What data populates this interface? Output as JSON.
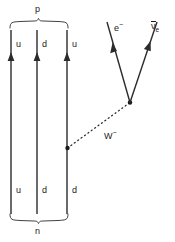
{
  "diagram": {
    "colors": {
      "line": "#2b2b2b",
      "background": "#ffffff",
      "text": "#1a1a1a"
    },
    "top_bracket": {
      "label": "p",
      "meaning": "proton"
    },
    "bottom_bracket": {
      "label": "n",
      "meaning": "neutron"
    },
    "quark_lines": [
      {
        "id": "quark-line-1",
        "top_label": "u",
        "bottom_label": "u",
        "x": 11,
        "arrow_y": 58
      },
      {
        "id": "quark-line-2",
        "top_label": "d",
        "bottom_label": "d",
        "x": 37,
        "arrow_y": 58
      },
      {
        "id": "quark-line-3",
        "top_label": "u",
        "bottom_label": "d",
        "x": 67,
        "arrow_y": 58
      }
    ],
    "boson": {
      "label": "W",
      "charge": "−",
      "style": "dotted",
      "from": {
        "x": 67,
        "y": 148
      },
      "to": {
        "x": 130,
        "y": 102
      }
    },
    "leptons": [
      {
        "id": "electron",
        "label": "e",
        "charge": "−",
        "from": {
          "x": 130,
          "y": 102
        },
        "to": {
          "x": 107,
          "y": 22
        }
      },
      {
        "id": "electron-antineutrino",
        "label": "ν",
        "subscript": "e",
        "overbar": true,
        "from": {
          "x": 130,
          "y": 102
        },
        "to": {
          "x": 157,
          "y": 22
        }
      }
    ],
    "vertices": [
      {
        "id": "weak-vertex-quark",
        "x": 67,
        "y": 148
      },
      {
        "id": "weak-vertex-lepton",
        "x": 130,
        "y": 102
      }
    ]
  }
}
